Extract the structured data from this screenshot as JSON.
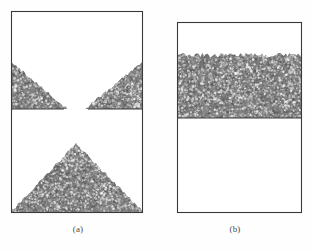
{
  "figure": {
    "background_color": "#fefefe",
    "border_color": "#3a3a3a",
    "granular_fill_color": "#808080",
    "granular_light_color": "#d8d8d8",
    "granular_dark_color": "#5a5a5a",
    "caption_color": "#4a4a4a"
  },
  "panels": [
    {
      "id": "panel-a",
      "caption": "(a)",
      "caption_x": 78,
      "caption_y": 230,
      "box": {
        "x": 11,
        "y": 11,
        "width": 132,
        "height": 202
      },
      "divider": {
        "y": 109,
        "left_segment": {
          "x_start": 11,
          "x_end": 64
        },
        "right_segment": {
          "x_start": 88,
          "x_end": 143
        },
        "orifice_gap": {
          "x_start": 64,
          "x_end": 88,
          "width": 24
        }
      },
      "upper_chamber": {
        "left_wedge": {
          "description": "inclined granular wedge at left, apex upper-left",
          "top_y": 62,
          "base_y": 109,
          "x_start": 11,
          "x_end": 67
        },
        "right_wedge": {
          "description": "inclined granular wedge at right, apex upper-right",
          "top_y": 62,
          "base_y": 109,
          "x_start": 85,
          "x_end": 143
        }
      },
      "lower_chamber": {
        "heap": {
          "description": "conical discharged heap",
          "apex_x": 76,
          "apex_y": 144,
          "base_y": 212,
          "base_x_start": 11,
          "base_x_end": 143
        }
      }
    },
    {
      "id": "panel-b",
      "caption": "(b)",
      "caption_x": 235,
      "caption_y": 230,
      "box": {
        "x": 177,
        "y": 22,
        "width": 125,
        "height": 191
      },
      "divider": {
        "y": 118,
        "left_segment": {
          "x_start": 177,
          "x_end": 302
        },
        "right_segment": {
          "x_start": 302,
          "x_end": 302
        },
        "orifice_gap": {
          "x_start": 302,
          "x_end": 302,
          "width": 0
        }
      },
      "upper_chamber": {
        "bed": {
          "description": "flat-topped packed granular bed",
          "surface_y": 55,
          "bottom_y": 118,
          "x_start": 177,
          "x_end": 302
        }
      },
      "lower_chamber": {
        "empty": true,
        "description": "empty receiving chamber"
      }
    }
  ]
}
